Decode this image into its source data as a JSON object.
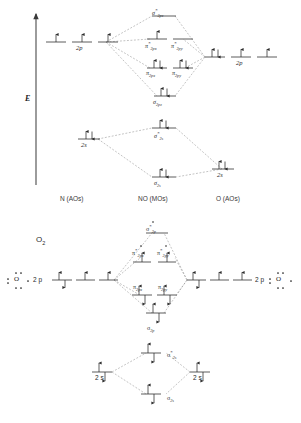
{
  "figure": {
    "title_top": "",
    "axis_label": "E",
    "columns": [
      {
        "label": "N (AOs)"
      },
      {
        "label": "NO (MOs)"
      },
      {
        "label": "O (AOs)"
      }
    ]
  },
  "diagram_no": {
    "name": "NO molecular orbital diagram",
    "left_atom": "N",
    "right_atom": "O",
    "left_levels": [
      {
        "id": "n-2p",
        "label": "2p",
        "slots": 3,
        "electrons": [
          "up",
          "up",
          "up"
        ]
      },
      {
        "id": "n-2s",
        "label": "2s",
        "slots": 1,
        "electrons": [
          "updown"
        ]
      }
    ],
    "right_levels": [
      {
        "id": "o-2p",
        "label": "2p",
        "slots": 3,
        "electrons": [
          "updown",
          "up",
          "up"
        ]
      },
      {
        "id": "o-2s",
        "label": "2s",
        "slots": 1,
        "electrons": [
          "updown"
        ]
      }
    ],
    "mo_levels": [
      {
        "id": "sigma-2pz-star",
        "label": "σ*2pz",
        "sym": "σ",
        "star": true,
        "sub": "2pz",
        "slots": 1,
        "electrons": []
      },
      {
        "id": "pi-2px-star",
        "label": "π*2px",
        "sym": "π",
        "star": true,
        "sub": "2px",
        "slots": 1,
        "electrons": [
          "up"
        ]
      },
      {
        "id": "pi-2py-star",
        "label": "π*2py",
        "sym": "π",
        "star": true,
        "sub": "2py",
        "slots": 1,
        "electrons": []
      },
      {
        "id": "pi-2px",
        "label": "π2px",
        "sym": "π",
        "star": false,
        "sub": "2px",
        "slots": 1,
        "electrons": [
          "updown"
        ]
      },
      {
        "id": "pi-2py",
        "label": "π2py",
        "sym": "π",
        "star": false,
        "sub": "2py",
        "slots": 1,
        "electrons": [
          "updown"
        ]
      },
      {
        "id": "sigma-2pz",
        "label": "σ2pz",
        "sym": "σ",
        "star": false,
        "sub": "2pz",
        "slots": 1,
        "electrons": [
          "updown"
        ]
      },
      {
        "id": "sigma-2s-star",
        "label": "σ*2s",
        "sym": "σ",
        "star": true,
        "sub": "2s",
        "slots": 1,
        "electrons": [
          "updown"
        ]
      },
      {
        "id": "sigma-2s",
        "label": "σ2s",
        "sym": "σ",
        "star": false,
        "sub": "2s",
        "slots": 1,
        "electrons": [
          "updown"
        ]
      }
    ]
  },
  "diagram_o2": {
    "name": "O2 molecular orbital diagram",
    "title": "O2",
    "shell_label_left": "2 p",
    "shell_label_right": "2 p",
    "shell_label_2s_left": "2 s",
    "shell_label_2s_right": "2 s",
    "lewis_left": "O",
    "lewis_right": "O",
    "left_levels": [
      {
        "id": "o2-left-2p",
        "label": "2 p",
        "slots": 3,
        "electrons": [
          "updown",
          "up",
          "up"
        ]
      },
      {
        "id": "o2-left-2s",
        "label": "2 s",
        "slots": 1,
        "electrons": [
          "updown"
        ]
      }
    ],
    "right_levels": [
      {
        "id": "o2-right-2p",
        "label": "2 p",
        "slots": 3,
        "electrons": [
          "updown",
          "up",
          "up"
        ]
      },
      {
        "id": "o2-right-2s",
        "label": "2 s",
        "slots": 1,
        "electrons": [
          "updown"
        ]
      }
    ],
    "mo_levels": [
      {
        "id": "o2-sigma-2p-star",
        "label": "σ*2p",
        "sym": "σ",
        "star": true,
        "sub": "2p",
        "slots": 1,
        "electrons": []
      },
      {
        "id": "o2-pi-2px-star",
        "label": "π*2px",
        "sym": "π",
        "star": true,
        "sub": "2px",
        "slots": 1,
        "electrons": [
          "up"
        ]
      },
      {
        "id": "o2-pi-2py-star",
        "label": "π*2py",
        "sym": "π",
        "star": true,
        "sub": "2py",
        "slots": 1,
        "electrons": [
          "up"
        ]
      },
      {
        "id": "o2-pi-2px",
        "label": "π2px",
        "sym": "π",
        "star": false,
        "sub": "2px",
        "slots": 1,
        "electrons": [
          "updown"
        ]
      },
      {
        "id": "o2-pi-2py",
        "label": "π2py",
        "sym": "π",
        "star": false,
        "sub": "2py",
        "slots": 1,
        "electrons": [
          "updown"
        ]
      },
      {
        "id": "o2-sigma-2p",
        "label": "σ2p",
        "sym": "σ",
        "star": false,
        "sub": "2p",
        "slots": 1,
        "electrons": [
          "updown"
        ]
      },
      {
        "id": "o2-sigma-2s-star",
        "label": "σ*2s",
        "sym": "σ",
        "star": true,
        "sub": "2s",
        "slots": 1,
        "electrons": [
          "updown"
        ]
      },
      {
        "id": "o2-sigma-2s",
        "label": "σ2s",
        "sym": "σ",
        "star": false,
        "sub": "2s",
        "slots": 1,
        "electrons": [
          "updown"
        ]
      }
    ]
  },
  "labels": {
    "sigma": "σ",
    "pi": "π",
    "star": "*",
    "sub_2px": "2p",
    "sub_x": "x",
    "sub_y": "y",
    "sub_z": "z",
    "sub_2s": "2s",
    "sub_2p": "2p",
    "n_2p": "2p",
    "n_2s": "2s",
    "o_2p": "2p",
    "o_2s": "2s",
    "col_left": "N (AOs)",
    "col_mid": "NO (MOs)",
    "col_right": "O (AOs)",
    "energy": "E",
    "o2": "O",
    "o2_sub": "2",
    "two_p": "2 p",
    "two_s": "2 s"
  },
  "colors": {
    "line": "#4a4a4a",
    "dash": "#8a8a8a",
    "text": "#1a1a1a",
    "arrow": "#2b2b2b",
    "background": "#ffffff"
  }
}
